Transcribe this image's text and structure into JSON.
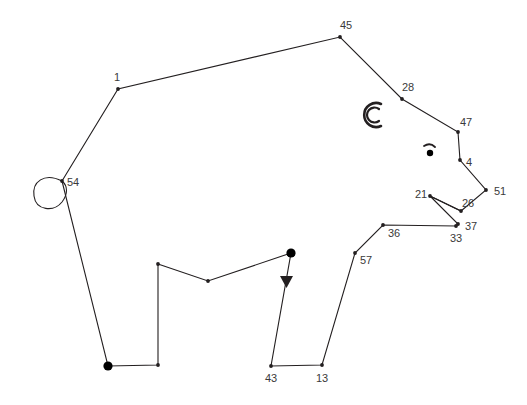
{
  "figure": {
    "background_color": "#ffffff",
    "line_color": "#231f20",
    "label_color": "#3a3a3a",
    "canvas": {
      "width": 527,
      "height": 405
    }
  },
  "nodes": [
    {
      "id": "1",
      "label": "1",
      "x": 118,
      "y": 89,
      "lx": 117,
      "ly": 78,
      "anchor": "middle",
      "size": "small"
    },
    {
      "id": "45",
      "label": "45",
      "x": 340,
      "y": 37,
      "lx": 346,
      "ly": 26,
      "anchor": "middle",
      "size": "small"
    },
    {
      "id": "28",
      "label": "28",
      "x": 402,
      "y": 99,
      "lx": 408,
      "ly": 88,
      "anchor": "middle",
      "size": "small"
    },
    {
      "id": "47",
      "label": "47",
      "x": 458,
      "y": 132,
      "lx": 466,
      "ly": 123,
      "anchor": "middle",
      "size": "small"
    },
    {
      "id": "4",
      "label": "4",
      "x": 460,
      "y": 160,
      "lx": 469,
      "ly": 163,
      "anchor": "middle",
      "size": "small"
    },
    {
      "id": "51",
      "label": "51",
      "x": 486,
      "y": 190,
      "lx": 500,
      "ly": 192,
      "anchor": "middle",
      "size": "small"
    },
    {
      "id": "26",
      "label": "26",
      "x": 461,
      "y": 211,
      "lx": 468,
      "ly": 204,
      "anchor": "middle",
      "size": "small"
    },
    {
      "id": "21",
      "label": "21",
      "x": 430,
      "y": 196,
      "lx": 421,
      "ly": 195,
      "anchor": "middle",
      "size": "small"
    },
    {
      "id": "37",
      "label": "37",
      "x": 458,
      "y": 224,
      "lx": 471,
      "ly": 227,
      "anchor": "middle",
      "size": "small"
    },
    {
      "id": "33",
      "label": "33",
      "x": 456,
      "y": 226,
      "lx": 456,
      "ly": 239,
      "anchor": "middle",
      "size": "small"
    },
    {
      "id": "36",
      "label": "36",
      "x": 383,
      "y": 225,
      "lx": 394,
      "ly": 234,
      "anchor": "middle",
      "size": "small"
    },
    {
      "id": "57",
      "label": "57",
      "x": 355,
      "y": 253,
      "lx": 366,
      "ly": 261,
      "anchor": "middle",
      "size": "small"
    },
    {
      "id": "13",
      "label": "13",
      "x": 322,
      "y": 365,
      "lx": 322,
      "ly": 379,
      "anchor": "middle",
      "size": "small"
    },
    {
      "id": "43",
      "label": "43",
      "x": 271,
      "y": 366,
      "lx": 271,
      "ly": 379,
      "anchor": "middle",
      "size": "small"
    },
    {
      "id": "54",
      "label": "54",
      "x": 62,
      "y": 181,
      "lx": 73,
      "ly": 183,
      "anchor": "middle",
      "size": "small"
    }
  ],
  "unlabeled_nodes": [
    {
      "id": "paw-front-left",
      "x": 108,
      "y": 366,
      "size": "big"
    },
    {
      "id": "paw-front-right",
      "x": 158,
      "y": 365,
      "size": "small"
    },
    {
      "id": "belly-left",
      "x": 158,
      "y": 264,
      "size": "small"
    },
    {
      "id": "belly-middle",
      "x": 208,
      "y": 281,
      "size": "small"
    },
    {
      "id": "belly-right",
      "x": 291,
      "y": 253,
      "size": "big"
    }
  ],
  "paths": {
    "body": "M 62 181 L 118 89 L 340 37 L 402 99 L 458 132 L 460 160 L 486 190 L 461 211 L 430 196 L 458 224 L 456 226 L 383 225 L 355 253 L 322 365 L 271 366 L 291 253 L 208 281 L 158 264 L 158 365 L 108 366 Z",
    "body_note": "closing segment runs from the front paw back up to node 54",
    "trunk_fork": "M 430 196 L 461 211",
    "tail_loop": "M 62 181 C 44 172, 32 182, 34 196 C 36 211, 54 212, 62 202 C 68 194, 68 186, 62 181 Z",
    "ear_outer": "M 381 104 A 12 12 0 1 0 381 126",
    "ear_inner": "M 379 109 A 7.5 7.5 0 1 0 379 121",
    "eyebrow": "M 424 146 Q 430 142, 435 147"
  },
  "markers": {
    "leg_arrow": {
      "x": 286,
      "y": 280,
      "points": "280,276 293,276 286.5,288"
    },
    "eye": {
      "x": 430,
      "y": 153,
      "r": 3.2
    }
  },
  "legend": {
    "labels_shown": [
      "1",
      "45",
      "28",
      "47",
      "4",
      "51",
      "26",
      "21",
      "37",
      "33",
      "36",
      "57",
      "13",
      "43",
      "54"
    ]
  }
}
